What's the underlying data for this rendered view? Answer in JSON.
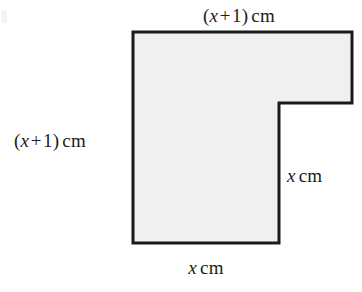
{
  "figure": {
    "kind": "composite-rectilinear-polygon",
    "fill_color": "#f0f0f0",
    "stroke_color": "#1a1a1a",
    "background_color": "#ffffff",
    "stroke_width": 3,
    "vertices": [
      {
        "name": "top-left",
        "x": 133,
        "y": 32
      },
      {
        "name": "top-right",
        "x": 352,
        "y": 32
      },
      {
        "name": "arm-bottom-right",
        "x": 352,
        "y": 103
      },
      {
        "name": "inner-notch-corner",
        "x": 279,
        "y": 103
      },
      {
        "name": "bottom-right",
        "x": 279,
        "y": 243
      },
      {
        "name": "bottom-left",
        "x": 133,
        "y": 243
      }
    ]
  },
  "labels": {
    "top": {
      "name": "top-edge-dimension",
      "open_paren": "(",
      "variable": "x",
      "operator": "+",
      "constant": "1",
      "close_paren": ")",
      "unit": "cm",
      "full_text": "(x + 1) cm"
    },
    "left": {
      "name": "left-edge-dimension",
      "open_paren": "(",
      "variable": "x",
      "operator": "+",
      "constant": "1",
      "close_paren": ")",
      "unit": "cm",
      "full_text": "(x + 1) cm"
    },
    "right": {
      "name": "right-edge-dimension",
      "variable": "x",
      "unit": "cm",
      "full_text": "x cm"
    },
    "bottom": {
      "name": "bottom-edge-dimension",
      "variable": "x",
      "unit": "cm",
      "full_text": "x cm"
    }
  }
}
